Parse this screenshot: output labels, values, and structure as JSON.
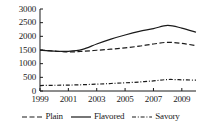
{
  "chart_data": {
    "type": "line",
    "title": "",
    "subtitle": "",
    "xlabel": "",
    "ylabel": "",
    "x": [
      1999,
      2000,
      2001,
      2002,
      2003,
      2004,
      2005,
      2006,
      2007,
      2008,
      2009,
      2010
    ],
    "xlim": [
      1999,
      2010
    ],
    "ylim": [
      0,
      3000
    ],
    "grid": false,
    "legend_position": "bottom",
    "x_tick_labels": [
      "1999",
      "2001",
      "2003",
      "2005",
      "2007",
      "2009"
    ],
    "x_tick_values": [
      1999,
      2001,
      2003,
      2005,
      2007,
      2009
    ],
    "y_tick_labels": [
      "0",
      "500",
      "1000",
      "1500",
      "2000",
      "2500",
      "3000"
    ],
    "y_tick_values": [
      0,
      500,
      1000,
      1500,
      2000,
      2500,
      3000
    ],
    "series": [
      {
        "name": "Plain",
        "style": "dashed",
        "color": "#1a1a1a",
        "values": [
          1500,
          1460,
          1430,
          1450,
          1490,
          1530,
          1580,
          1640,
          1720,
          1780,
          1740,
          1660
        ]
      },
      {
        "name": "Flavored",
        "style": "solid",
        "color": "#1a1a1a",
        "values": [
          1490,
          1460,
          1450,
          1520,
          1720,
          1900,
          2050,
          2180,
          2280,
          2400,
          2300,
          2150
        ]
      },
      {
        "name": "Savory",
        "style": "dash-dot",
        "color": "#1a1a1a",
        "values": [
          200,
          210,
          215,
          230,
          250,
          275,
          300,
          330,
          370,
          420,
          410,
          395
        ]
      }
    ]
  },
  "legend": {
    "items": [
      {
        "label": "Plain",
        "style": "dashed"
      },
      {
        "label": "Flavored",
        "style": "solid"
      },
      {
        "label": "Savory",
        "style": "dash-dot"
      }
    ]
  },
  "colors": {
    "ink": "#1a1a1a",
    "axis": "#1a1a1a",
    "background": "#ffffff"
  }
}
